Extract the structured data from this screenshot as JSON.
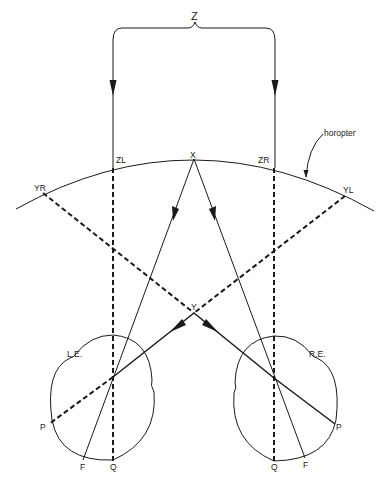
{
  "diagram": {
    "labels": {
      "z": "Z",
      "x": "X",
      "y": "Y",
      "zl": "ZL",
      "zr": "ZR",
      "yr": "YR",
      "yl": "YL",
      "horopter": "horopter",
      "left_eye": "L.E.",
      "right_eye": "R.E.",
      "left_p": "P",
      "left_f": "F",
      "left_q": "Q",
      "right_p": "P",
      "right_f": "F",
      "right_q": "Q"
    },
    "colors": {
      "ink": "#1a1a1a",
      "background": "#ffffff"
    }
  }
}
